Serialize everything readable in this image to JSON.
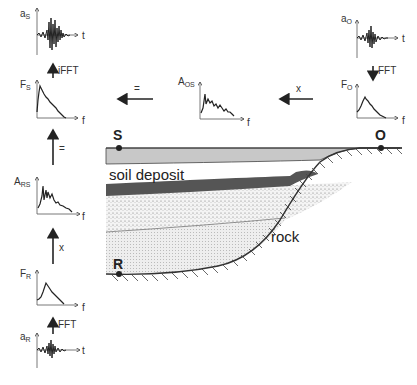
{
  "diagram": {
    "points": {
      "S": "S",
      "O": "O",
      "R": "R"
    },
    "layers": {
      "soil_label": "soil deposit",
      "rock_label": "rock"
    },
    "left_column": {
      "a_s": {
        "sym": "a",
        "sub": "S",
        "x_axis": "t"
      },
      "op_ifft": "iFFT",
      "f_s": {
        "sym": "F",
        "sub": "S",
        "x_axis": "f"
      },
      "op_equals": "=",
      "a_rs": {
        "sym": "A",
        "sub": "RS",
        "x_axis": "f"
      },
      "op_times": "x",
      "f_r": {
        "sym": "F",
        "sub": "R",
        "x_axis": "f"
      },
      "op_fft": "FFT",
      "a_r": {
        "sym": "a",
        "sub": "R",
        "x_axis": "t"
      }
    },
    "right_column": {
      "a_o": {
        "sym": "a",
        "sub": "O",
        "x_axis": "t"
      },
      "op_fft": "FFT",
      "f_o": {
        "sym": "F",
        "sub": "O",
        "x_axis": "f"
      }
    },
    "top_row": {
      "op_equals": "=",
      "a_os": {
        "sym": "A",
        "sub": "OS",
        "x_axis": "f"
      },
      "op_times": "x"
    },
    "colors": {
      "top_layer": "#c8c8c8",
      "dark_layer": "#555555",
      "stroke": "#333333"
    }
  }
}
